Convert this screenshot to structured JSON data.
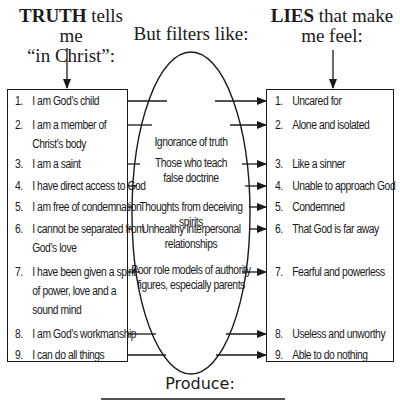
{
  "headings": {
    "truth": {
      "bold": "TRUTH",
      "rest_line1": " tells me",
      "line2": "“in Christ”:"
    },
    "filters": "But filters like:",
    "lies": {
      "bold": "LIES",
      "rest_line1": " that make",
      "line2": "me feel:"
    }
  },
  "truth_items": [
    {
      "num": "1.",
      "lines": [
        "I am God’s child"
      ]
    },
    {
      "num": "2.",
      "lines": [
        "I am a member of",
        "Christ’s body"
      ]
    },
    {
      "num": "3.",
      "lines": [
        "I am a saint"
      ]
    },
    {
      "num": "4.",
      "lines": [
        "I have direct access to God"
      ]
    },
    {
      "num": "5.",
      "lines": [
        "I am free of condemnation"
      ]
    },
    {
      "num": "6.",
      "lines": [
        "I cannot be separated from",
        "God’s love"
      ]
    },
    {
      "num": "7.",
      "lines": [
        "I have been given a spirit",
        "of power, love and a",
        "sound mind"
      ]
    },
    {
      "num": "8.",
      "lines": [
        "I am God’s workmanship"
      ]
    },
    {
      "num": "9.",
      "lines": [
        "I can do all things"
      ]
    }
  ],
  "filters": [
    {
      "lines": [
        "Ignorance of truth"
      ]
    },
    {
      "lines": [
        "Those who teach",
        "false doctrine"
      ]
    },
    {
      "lines": [
        "Thoughts from deceiving spirits"
      ]
    },
    {
      "lines": [
        "Unhealthy interpersonal",
        "relationships"
      ]
    },
    {
      "lines": [
        "Poor role models of authority",
        "figures, especially parents"
      ]
    }
  ],
  "lie_items": [
    {
      "num": "1.",
      "text": "Uncared for"
    },
    {
      "num": "2.",
      "text": "Alone and isolated"
    },
    {
      "num": "3.",
      "text": "Like a sinner"
    },
    {
      "num": "4.",
      "text": "Unable to approach God"
    },
    {
      "num": "5.",
      "text": "Condemned"
    },
    {
      "num": "6.",
      "text": "That God is far away"
    },
    {
      "num": "7.",
      "text": "Fearful and powerless"
    },
    {
      "num": "8.",
      "text": "Useless and unworthy"
    },
    {
      "num": "9.",
      "text": "Able to do nothing"
    }
  ],
  "footer": {
    "produce": "Produce:"
  },
  "colors": {
    "ink": "#1a1a1a",
    "background": "#ffffff"
  }
}
